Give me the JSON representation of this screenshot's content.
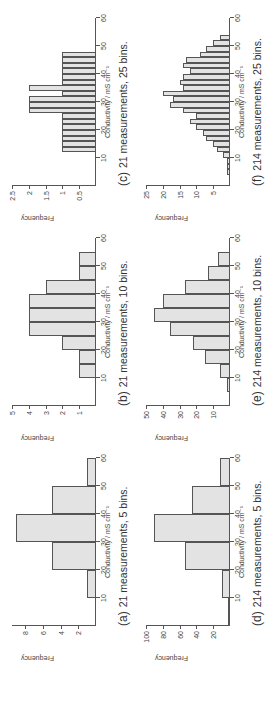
{
  "figure": {
    "xlabel": "Conductivity / mS cm⁻¹",
    "ylabel": "Frequency",
    "bar_fill": "#e3e3e3",
    "bar_edge": "#555555"
  },
  "panels": [
    {
      "tag": "(a)",
      "caption": "21 measurements, 5 bins."
    },
    {
      "tag": "(b)",
      "caption": "21 measurements, 10 bins."
    },
    {
      "tag": "(c)",
      "caption": "21 measurements, 25 bins."
    },
    {
      "tag": "(d)",
      "caption": "214 measurements, 5 bins."
    },
    {
      "tag": "(e)",
      "caption": "214 measurements, 10 bins."
    },
    {
      "tag": "(f)",
      "caption": "214 measurements, 25 bins."
    }
  ],
  "chart_data": [
    {
      "id": "a",
      "type": "bar",
      "title": "(a) 21 measurements, 5 bins.",
      "xlabel": "Conductivity / mS cm⁻¹",
      "ylabel": "Frequency",
      "xlim": [
        0,
        60
      ],
      "ylim": [
        0,
        9.5
      ],
      "xticks": [
        10,
        20,
        30,
        40,
        50,
        60
      ],
      "yticks": [
        2,
        4,
        6,
        8
      ],
      "bin_edges": [
        10,
        20,
        30,
        40,
        50,
        60
      ],
      "values": [
        1,
        5,
        9,
        5,
        1
      ]
    },
    {
      "id": "b",
      "type": "bar",
      "title": "(b) 21 measurements, 10 bins.",
      "xlabel": "Conductivity / mS cm⁻¹",
      "ylabel": "Frequency",
      "xlim": [
        0,
        60
      ],
      "ylim": [
        0,
        5
      ],
      "xticks": [
        10,
        20,
        30,
        40,
        50,
        60
      ],
      "yticks": [
        1,
        2,
        3,
        4,
        5
      ],
      "bin_edges": [
        10,
        15,
        20,
        25,
        30,
        35,
        40,
        45,
        50,
        55
      ],
      "values": [
        1,
        1,
        2,
        4,
        4,
        4,
        3,
        1,
        1
      ]
    },
    {
      "id": "c",
      "type": "bar",
      "title": "(c) 21 measurements, 25 bins.",
      "xlabel": "Conductivity / mS cm⁻¹",
      "ylabel": "Frequency",
      "xlim": [
        0,
        60
      ],
      "ylim": [
        0,
        2.5
      ],
      "xticks": [
        10,
        20,
        30,
        40,
        50,
        60
      ],
      "yticks": [
        0.5,
        1,
        1.5,
        2,
        2.5
      ],
      "bin_edges": [
        12,
        14,
        16,
        18,
        20,
        22,
        24,
        26,
        28,
        30,
        32,
        34,
        36,
        38,
        40,
        42,
        44,
        46,
        48
      ],
      "values": [
        1,
        1,
        1,
        1,
        1,
        1,
        1,
        2,
        2,
        2,
        1,
        2,
        1,
        1,
        1,
        1,
        1,
        1
      ]
    },
    {
      "id": "d",
      "type": "bar",
      "title": "(d) 214 measurements, 5 bins.",
      "xlabel": "Conductivity / mS cm⁻¹",
      "ylabel": "Frequency",
      "xlim": [
        0,
        60
      ],
      "ylim": [
        0,
        100
      ],
      "xticks": [
        10,
        20,
        30,
        40,
        50,
        60
      ],
      "yticks": [
        20,
        40,
        60,
        80,
        100
      ],
      "bin_edges": [
        0,
        10,
        20,
        30,
        40,
        50,
        60
      ],
      "values": [
        1,
        9,
        53,
        91,
        45,
        12
      ]
    },
    {
      "id": "e",
      "type": "bar",
      "title": "(e) 214 measurements, 10 bins.",
      "xlabel": "Conductivity / mS cm⁻¹",
      "ylabel": "Frequency",
      "xlim": [
        0,
        60
      ],
      "ylim": [
        0,
        50
      ],
      "xticks": [
        10,
        20,
        30,
        40,
        50,
        60
      ],
      "yticks": [
        10,
        20,
        30,
        40,
        50
      ],
      "bin_edges": [
        5,
        10,
        15,
        20,
        25,
        30,
        35,
        40,
        45,
        50,
        55
      ],
      "values": [
        2,
        6,
        15,
        22,
        36,
        45,
        40,
        27,
        13,
        7
      ]
    },
    {
      "id": "f",
      "type": "bar",
      "title": "(f) 214 measurements, 25 bins.",
      "xlabel": "Conductivity / mS cm⁻¹",
      "ylabel": "Frequency",
      "xlim": [
        0,
        60
      ],
      "ylim": [
        0,
        25
      ],
      "xticks": [
        10,
        20,
        30,
        40,
        50,
        60
      ],
      "yticks": [
        5,
        10,
        15,
        20,
        25
      ],
      "bin_edges": [
        4,
        6,
        8,
        10,
        12,
        14,
        16,
        18,
        20,
        22,
        24,
        26,
        28,
        30,
        32,
        34,
        36,
        38,
        40,
        42,
        44,
        46,
        48,
        50,
        52
      ],
      "values": [
        1,
        1,
        1,
        2,
        4,
        5,
        7,
        8,
        10,
        12,
        10,
        14,
        18,
        17,
        20,
        14,
        15,
        14,
        12,
        14,
        13,
        9,
        7,
        5,
        3
      ]
    }
  ]
}
